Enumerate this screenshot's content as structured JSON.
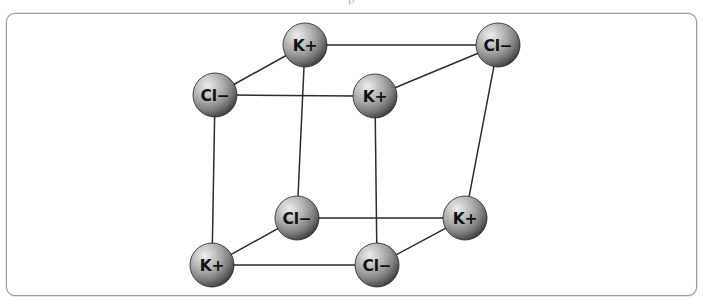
{
  "figure": {
    "clipped_caption_above": "p",
    "border_color": "#9a9a9a",
    "background_color": "#ffffff"
  },
  "diagram": {
    "type": "ball-and-stick-cube",
    "projection": "oblique",
    "bond_color": "#2c2c2c",
    "sphere_radius": 22,
    "sphere_colors": {
      "highlight": "#e8e8e8",
      "midtone": "#9a9a9a",
      "shadow": "#3a3a3a",
      "rim": "#222222"
    },
    "ions": [
      {
        "id": "back-top-left",
        "label": "K+",
        "species": "potassium",
        "charge": "+",
        "cx": 305,
        "cy": 45,
        "face": "back"
      },
      {
        "id": "back-top-right",
        "label": "Cl−",
        "species": "chloride",
        "charge": "−",
        "cx": 498,
        "cy": 45,
        "face": "back"
      },
      {
        "id": "front-top-left",
        "label": "Cl−",
        "species": "chloride",
        "charge": "−",
        "cx": 215,
        "cy": 95,
        "face": "front"
      },
      {
        "id": "front-top-right",
        "label": "K+",
        "species": "potassium",
        "charge": "+",
        "cx": 375,
        "cy": 96,
        "face": "front"
      },
      {
        "id": "back-bottom-left",
        "label": "Cl−",
        "species": "chloride",
        "charge": "−",
        "cx": 297,
        "cy": 218,
        "face": "back"
      },
      {
        "id": "back-bottom-right",
        "label": "K+",
        "species": "potassium",
        "charge": "+",
        "cx": 465,
        "cy": 218,
        "face": "back"
      },
      {
        "id": "front-bottom-left",
        "label": "K+",
        "species": "potassium",
        "charge": "+",
        "cx": 212,
        "cy": 265,
        "face": "front"
      },
      {
        "id": "front-bottom-right",
        "label": "Cl−",
        "species": "chloride",
        "charge": "−",
        "cx": 377,
        "cy": 265,
        "face": "front"
      }
    ],
    "bonds": [
      {
        "from": "back-top-left",
        "to": "back-top-right",
        "edge": "back-top"
      },
      {
        "from": "back-top-left",
        "to": "back-bottom-left",
        "edge": "back-left-vertical"
      },
      {
        "from": "back-top-right",
        "to": "back-bottom-right",
        "edge": "back-right-vertical"
      },
      {
        "from": "back-bottom-left",
        "to": "back-bottom-right",
        "edge": "back-bottom"
      },
      {
        "from": "front-top-left",
        "to": "front-top-right",
        "edge": "front-top"
      },
      {
        "from": "front-top-left",
        "to": "front-bottom-left",
        "edge": "front-left-vertical"
      },
      {
        "from": "front-top-right",
        "to": "front-bottom-right",
        "edge": "front-right-vertical"
      },
      {
        "from": "front-bottom-left",
        "to": "front-bottom-right",
        "edge": "front-bottom"
      },
      {
        "from": "front-top-left",
        "to": "back-top-left",
        "edge": "depth-top-left"
      },
      {
        "from": "front-top-right",
        "to": "back-top-right",
        "edge": "depth-top-right"
      },
      {
        "from": "front-bottom-left",
        "to": "back-bottom-left",
        "edge": "depth-bottom-left"
      },
      {
        "from": "front-bottom-right",
        "to": "back-bottom-right",
        "edge": "depth-bottom-right"
      }
    ]
  }
}
